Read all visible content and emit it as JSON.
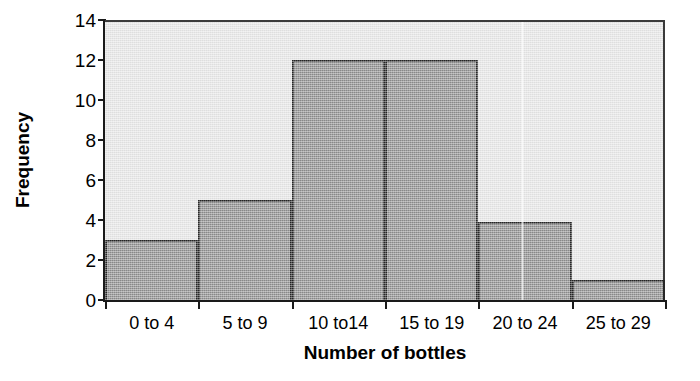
{
  "chart_data": {
    "type": "bar",
    "title": "",
    "subtitle": "",
    "xlabel": "Number of bottles",
    "ylabel": "Frequency",
    "categories": [
      "0 to 4",
      "5 to 9",
      "10 to14",
      "15 to 19",
      "20 to 24",
      "25 to 29"
    ],
    "values": [
      3,
      5,
      12,
      12,
      3.9,
      1
    ],
    "ylim": [
      0,
      14
    ],
    "xlim_categories": 6,
    "y_ticks": [
      0,
      2,
      4,
      6,
      8,
      10,
      12,
      14
    ],
    "y_tick_labels": [
      "0",
      "2",
      "4",
      "6",
      "8",
      "10",
      "12",
      "14"
    ],
    "grid": false,
    "legend": null,
    "legend_position": "none",
    "annotations": [],
    "bar_gap": 0,
    "histogram": true
  },
  "style": {
    "plot_background": "#e6e6e6",
    "bar_fill": "#8d8d8d",
    "bar_edge": "#262626",
    "axis_color": "#1a1a1a",
    "text_color": "#000000",
    "page_background": "#ffffff"
  }
}
